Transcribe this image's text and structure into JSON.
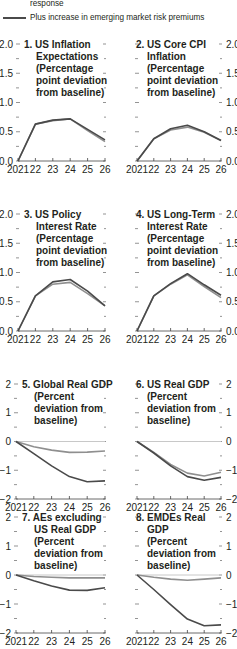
{
  "legend": {
    "items": [
      {
        "label": "response",
        "color": "#8a8a8a"
      },
      {
        "label": "Plus increase in emerging market risk premiums",
        "color": "#4a4a4a"
      }
    ]
  },
  "chart_data": [
    {
      "type": "line",
      "title": "1. US Inflation Expectations (Percentage point deviation from baseline)",
      "title_lines": [
        "1. US Inflation",
        "Expectations",
        "(Percentage",
        "point deviation",
        "from baseline)"
      ],
      "x": [
        "2021",
        "22",
        "23",
        "24",
        "25",
        "26"
      ],
      "ylim": [
        0,
        2.0
      ],
      "yticks": [
        "0.0",
        "0.5",
        "1.0",
        "1.5",
        "2.0"
      ],
      "yaxis_side": "left",
      "series": [
        {
          "name": "response",
          "values": [
            0.0,
            0.63,
            0.69,
            0.72,
            0.52,
            0.33
          ]
        },
        {
          "name": "Plus increase in emerging market risk premiums",
          "values": [
            0.0,
            0.63,
            0.7,
            0.72,
            0.54,
            0.36
          ]
        }
      ]
    },
    {
      "type": "line",
      "title": "2. US Core CPI Inflation (Percentage point deviation from baseline)",
      "title_lines": [
        "2. US Core CPI",
        "Inflation",
        "(Percentage",
        "point deviation",
        "from baseline)"
      ],
      "x": [
        "2021",
        "22",
        "23",
        "24",
        "25",
        "26"
      ],
      "ylim": [
        0,
        2.0
      ],
      "yticks": [
        "0.0",
        "0.5",
        "1.0",
        "1.5",
        "2.0"
      ],
      "yaxis_side": "right",
      "series": [
        {
          "name": "response",
          "values": [
            0.0,
            0.38,
            0.53,
            0.58,
            0.49,
            0.35
          ]
        },
        {
          "name": "Plus increase in emerging market risk premiums",
          "values": [
            0.0,
            0.38,
            0.55,
            0.61,
            0.5,
            0.35
          ]
        }
      ]
    },
    {
      "type": "line",
      "title": "3. US Policy Interest Rate (Percentage point deviation from baseline)",
      "title_lines": [
        "3. US Policy",
        "Interest Rate",
        "(Percentage",
        "point deviation",
        "from baseline)"
      ],
      "x": [
        "2021",
        "22",
        "23",
        "24",
        "25",
        "26"
      ],
      "ylim": [
        0,
        2.0
      ],
      "yticks": [
        "0.0",
        "0.5",
        "1.0",
        "1.5",
        "2.0"
      ],
      "yaxis_side": "left",
      "series": [
        {
          "name": "response",
          "values": [
            0.0,
            0.6,
            0.8,
            0.83,
            0.64,
            0.43
          ]
        },
        {
          "name": "Plus increase in emerging market risk premiums",
          "values": [
            0.0,
            0.6,
            0.84,
            0.88,
            0.68,
            0.43
          ]
        }
      ]
    },
    {
      "type": "line",
      "title": "4. US Long-Term Interest Rate (Percentage point deviation from baseline)",
      "title_lines": [
        "4. US Long-Term",
        "Interest Rate",
        "(Percentage",
        "point deviation",
        "from baseline)"
      ],
      "x": [
        "2021",
        "22",
        "23",
        "24",
        "25",
        "26"
      ],
      "ylim": [
        0,
        2.0
      ],
      "yticks": [
        "0.0",
        "0.5",
        "1.0",
        "1.5",
        "2.0"
      ],
      "yaxis_side": "right",
      "series": [
        {
          "name": "response",
          "values": [
            0.0,
            0.6,
            0.8,
            0.96,
            0.76,
            0.57
          ]
        },
        {
          "name": "Plus increase in emerging market risk premiums",
          "values": [
            0.0,
            0.6,
            0.81,
            0.98,
            0.79,
            0.61
          ]
        }
      ]
    },
    {
      "type": "line",
      "title": "5. Global Real GDP (Percent deviation from baseline)",
      "title_lines": [
        "5. Global Real GDP",
        "(Percent",
        "deviation from",
        "baseline)"
      ],
      "x": [
        "2021",
        "22",
        "23",
        "24",
        "25",
        "26"
      ],
      "ylim": [
        -2,
        2
      ],
      "yticks": [
        "-2",
        "-1",
        "0",
        "1",
        "2"
      ],
      "yaxis_side": "left",
      "series": [
        {
          "name": "response",
          "values": [
            0.0,
            -0.18,
            -0.3,
            -0.38,
            -0.37,
            -0.33
          ]
        },
        {
          "name": "Plus increase in emerging market risk premiums",
          "values": [
            0.0,
            -0.42,
            -0.85,
            -1.22,
            -1.4,
            -1.37
          ]
        }
      ]
    },
    {
      "type": "line",
      "title": "6. US Real GDP (Percent deviation from baseline)",
      "title_lines": [
        "6. US Real GDP",
        "(Percent",
        "deviation from",
        "baseline)"
      ],
      "x": [
        "2021",
        "22",
        "23",
        "24",
        "25",
        "26"
      ],
      "ylim": [
        -2,
        2
      ],
      "yticks": [
        "-2",
        "-1",
        "0",
        "1",
        "2"
      ],
      "yaxis_side": "right",
      "series": [
        {
          "name": "response",
          "values": [
            0.0,
            -0.38,
            -0.8,
            -1.1,
            -1.2,
            -1.07
          ]
        },
        {
          "name": "Plus increase in emerging market risk premiums",
          "values": [
            0.0,
            -0.4,
            -0.85,
            -1.22,
            -1.35,
            -1.25
          ]
        }
      ]
    },
    {
      "type": "line",
      "title": "7. AEs excluding US Real GDP (Percent deviation from baseline)",
      "title_lines": [
        "7. AEs excluding",
        "US Real GDP",
        "(Percent",
        "deviation from",
        "baseline)"
      ],
      "x": [
        "2021",
        "22",
        "23",
        "24",
        "25",
        "26"
      ],
      "ylim": [
        -2,
        2
      ],
      "yticks": [
        "-2",
        "-1",
        "0",
        "1",
        "2"
      ],
      "yaxis_side": "left",
      "series": [
        {
          "name": "response",
          "values": [
            0.0,
            -0.05,
            -0.08,
            -0.1,
            -0.1,
            -0.1
          ]
        },
        {
          "name": "Plus increase in emerging market risk premiums",
          "values": [
            0.0,
            -0.2,
            -0.38,
            -0.52,
            -0.53,
            -0.44
          ]
        }
      ]
    },
    {
      "type": "line",
      "title": "8. EMDEs Real GDP (Percent deviation from baseline)",
      "title_lines": [
        "8. EMDEs Real",
        "GDP",
        "(Percent",
        "deviation from",
        "baseline)"
      ],
      "x": [
        "2021",
        "22",
        "23",
        "24",
        "25",
        "26"
      ],
      "ylim": [
        -2,
        2
      ],
      "yticks": [
        "-2",
        "-1",
        "0",
        "1",
        "2"
      ],
      "yaxis_side": "right",
      "series": [
        {
          "name": "response",
          "values": [
            0.0,
            -0.08,
            -0.14,
            -0.18,
            -0.14,
            -0.1
          ]
        },
        {
          "name": "Plus increase in emerging market risk premiums",
          "values": [
            0.0,
            -0.5,
            -1.02,
            -1.52,
            -1.75,
            -1.72
          ]
        }
      ]
    }
  ]
}
